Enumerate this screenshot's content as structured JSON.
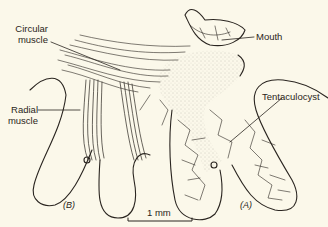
{
  "diagram": {
    "labels": {
      "circular_muscle": [
        "Circular",
        "muscle"
      ],
      "radial_muscle": [
        "Radial",
        "muscle"
      ],
      "mouth": "Mouth",
      "tentaculocyst": "Tentaculocyst",
      "panel_b": "(B)",
      "panel_a": "(A)"
    },
    "scale_bar": {
      "label": "1 mm"
    },
    "colors": {
      "background": "#fbf8ea",
      "ink": "#2a2520",
      "stipple": "#9a948a"
    }
  }
}
